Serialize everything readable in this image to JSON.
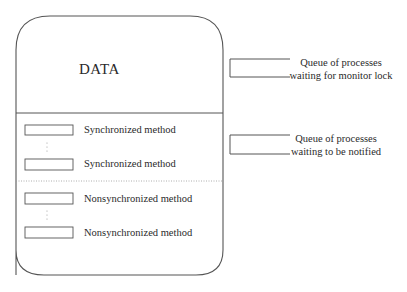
{
  "monitor": {
    "data_label": "DATA",
    "methods": [
      {
        "label": "Synchronized method",
        "type": "synchronized"
      },
      {
        "label": "Synchronized method",
        "type": "synchronized"
      },
      {
        "label": "Nonsynchronized method",
        "type": "nonsynchronized"
      },
      {
        "label": "Nonsynchronized method",
        "type": "nonsynchronized"
      }
    ]
  },
  "queues": [
    {
      "line1": "Queue of processes",
      "line2": "waiting for monitor lock"
    },
    {
      "line1": "Queue of processes",
      "line2": "waiting to be notified"
    }
  ],
  "colors": {
    "stroke": "#555555",
    "dotted": "#999999",
    "text": "#2a2a2a"
  }
}
